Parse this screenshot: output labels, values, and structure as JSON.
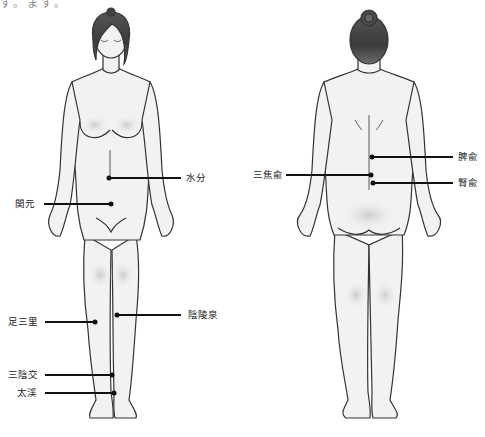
{
  "caption_fragment": "す。ます。",
  "figures": {
    "front": {
      "view": "front",
      "label": "front-body-figure"
    },
    "back": {
      "view": "back",
      "label": "back-body-figure"
    }
  },
  "acupoints": {
    "front": [
      {
        "name": "水分",
        "side": "right",
        "dot": [
          109,
          178
        ],
        "line_end": 181,
        "label_x": 186
      },
      {
        "name": "関元",
        "side": "left",
        "dot": [
          111,
          204
        ],
        "line_start": 44,
        "label_x": 15
      },
      {
        "name": "足三里",
        "side": "left",
        "dot": [
          95,
          322
        ],
        "line_start": 45,
        "label_x": 8
      },
      {
        "name": "陰陵泉",
        "side": "right",
        "dot": [
          117,
          315
        ],
        "line_end": 181,
        "label_x": 188
      },
      {
        "name": "三陰交",
        "side": "left",
        "dot": [
          112,
          375
        ],
        "line_start": 45,
        "label_x": 8
      },
      {
        "name": "太渓",
        "side": "left",
        "dot": [
          114,
          393
        ],
        "line_start": 45,
        "label_x": 17
      }
    ],
    "back": [
      {
        "name": "脾兪",
        "side": "right",
        "dot": [
          372,
          157
        ],
        "line_end": 453,
        "label_x": 458
      },
      {
        "name": "三焦兪",
        "side": "left",
        "dot": [
          371,
          175
        ],
        "line_start": 286,
        "label_x": 253
      },
      {
        "name": "腎兪",
        "side": "right",
        "dot": [
          373,
          183
        ],
        "line_end": 453,
        "label_x": 458
      }
    ]
  },
  "colors": {
    "skin": "#f2f2f2",
    "shade": "#cfcfcf",
    "outline": "#333333",
    "hair": "#4a4a4a",
    "leader": "#111111"
  }
}
